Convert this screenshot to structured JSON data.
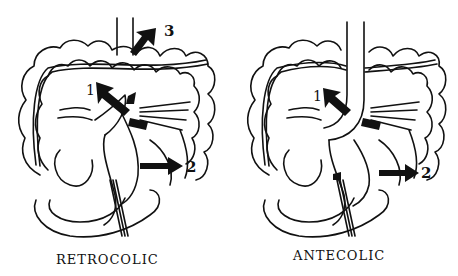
{
  "figure": {
    "panels": [
      {
        "id": "retrocolic",
        "caption": "RETROCOLIC",
        "labels": {
          "one": "1",
          "two": "2",
          "three": "3"
        }
      },
      {
        "id": "antecolic",
        "caption": "ANTECOLIC",
        "labels": {
          "one": "1",
          "two": "2"
        }
      }
    ],
    "colors": {
      "line": "#111111",
      "background": "#ffffff"
    }
  }
}
